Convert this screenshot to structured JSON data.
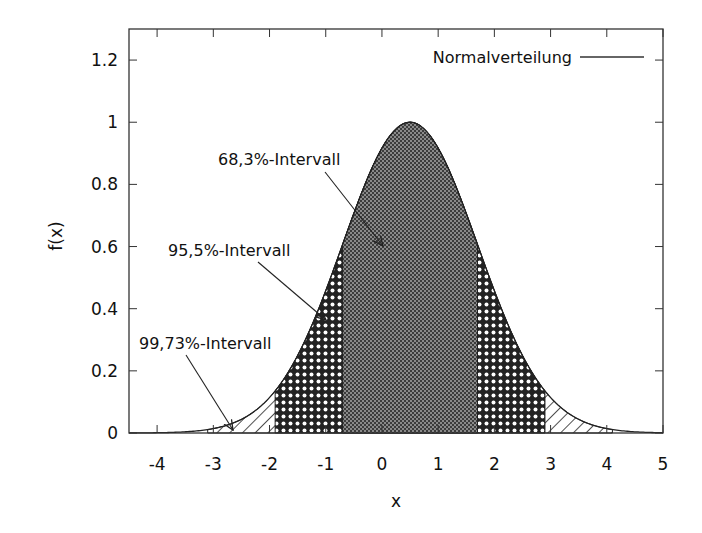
{
  "chart_data": {
    "type": "area",
    "title": "",
    "xlabel": "x",
    "ylabel": "f(x)",
    "xlim": [
      -4.5,
      5
    ],
    "ylim": [
      0,
      1.3
    ],
    "x_ticks": [
      "-4",
      "-3",
      "-2",
      "-1",
      "0",
      "1",
      "2",
      "3",
      "4",
      "5"
    ],
    "y_ticks": [
      "0",
      "0.2",
      "0.4",
      "0.6",
      "0.8",
      "1",
      "1.2"
    ],
    "grid": false,
    "legend": {
      "position": "top-right",
      "entries": [
        "Normalverteilung"
      ]
    },
    "series": [
      {
        "name": "Normalverteilung",
        "function": "exp(-(x-0.5)^2/(2*1.2^2))",
        "mean": 0.5,
        "sigma": 1.2,
        "peak": 1.0
      }
    ],
    "shaded_intervals": [
      {
        "label": "68,3%-Intervall",
        "from": -0.7,
        "to": 1.7,
        "pattern": "fine-checker"
      },
      {
        "label": "95,5%-Intervall",
        "from": -1.9,
        "to": 2.9,
        "pattern": "coarse-checker"
      },
      {
        "label": "99,73%-Intervall",
        "from": -3.1,
        "to": 4.1,
        "pattern": "diagonal-hatch"
      }
    ],
    "annotations": [
      {
        "text": "68,3%-Intervall",
        "x": -0.2,
        "y": 0.92
      },
      {
        "text": "95,5%-Intervall",
        "x": -1.1,
        "y": 0.6
      },
      {
        "text": "99,73%-Intervall",
        "x": -2.0,
        "y": 0.27
      }
    ]
  },
  "labels": {
    "xlabel": "x",
    "ylabel": "f(x)",
    "legend": "Normalverteilung",
    "anno68": "68,3%-Intervall",
    "anno95": "95,5%-Intervall",
    "anno99": "99,73%-Intervall"
  }
}
